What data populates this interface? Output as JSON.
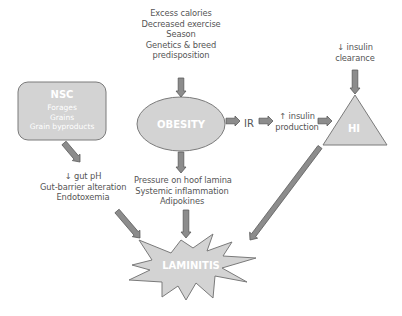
{
  "diagram": {
    "nodes": {
      "nsc": {
        "title": "NSC",
        "items": [
          "Forages",
          "Grains",
          "Grain byproducts"
        ]
      },
      "obesity": {
        "title": "OBESITY"
      },
      "ir": {
        "title": "IR"
      },
      "hi": {
        "title": "HI"
      },
      "laminitis": {
        "title": "LAMINITIS"
      }
    },
    "labels": {
      "obesity_causes": [
        "Excess calories",
        "Decreased exercise",
        "Season",
        "Genetics & breed",
        "predisposition"
      ],
      "insulin_clearance": [
        "↓ insulin",
        "clearance"
      ],
      "insulin_production": [
        "↑ insulin",
        "production"
      ],
      "gut_effects": [
        "↓ gut pH",
        "Gut-barrier alteration",
        "Endotoxemia"
      ],
      "obesity_effects": [
        "Pressure on hoof lamina",
        "Systemic inflammation",
        "Adipokines"
      ]
    },
    "edges": [
      {
        "from": "obesity_causes",
        "to": "obesity"
      },
      {
        "from": "obesity",
        "to": "ir"
      },
      {
        "from": "ir",
        "to": "insulin_production"
      },
      {
        "from": "insulin_production",
        "to": "hi"
      },
      {
        "from": "insulin_clearance",
        "to": "hi"
      },
      {
        "from": "nsc",
        "to": "gut_effects"
      },
      {
        "from": "obesity",
        "to": "obesity_effects"
      },
      {
        "from": "gut_effects",
        "to": "laminitis"
      },
      {
        "from": "obesity_effects",
        "to": "laminitis"
      },
      {
        "from": "hi",
        "to": "laminitis"
      }
    ],
    "colors": {
      "shape_fill": "#d3d3d3",
      "shape_stroke": "#7a7a7a",
      "arrow_fill": "#8c8c8c",
      "arrow_stroke": "#5a5a5a",
      "text": "#555555"
    }
  }
}
